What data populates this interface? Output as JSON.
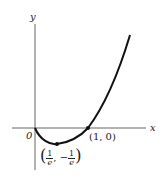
{
  "diagram": {
    "function": "y = x ln x",
    "axes": {
      "x_label": "x",
      "y_label": "y",
      "origin_label": "0"
    },
    "points": [
      {
        "label": "(1, 0)",
        "x": 1,
        "y": 0
      },
      {
        "label_parts": {
          "x_num": "1",
          "x_den": "e",
          "y_sign": "−",
          "y_num": "1",
          "y_den": "e"
        },
        "x": "1/e",
        "y": "-1/e"
      }
    ],
    "colors": {
      "curve": "#111111",
      "axes": "#555555"
    }
  }
}
